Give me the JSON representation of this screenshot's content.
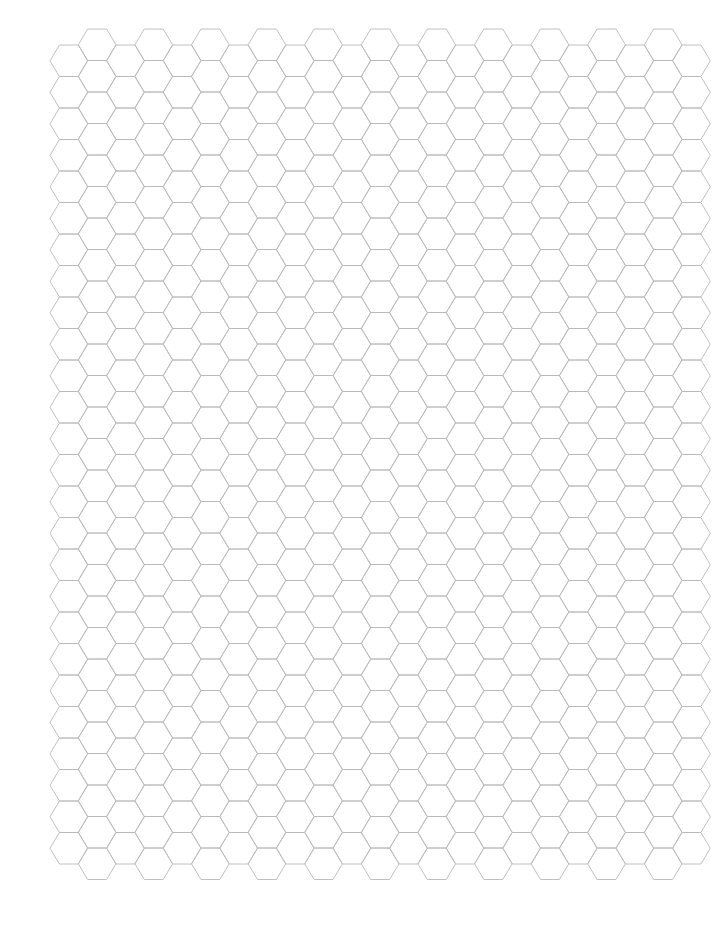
{
  "page": {
    "background": "#ffffff"
  },
  "hex_grid": {
    "orientation": "flat-top",
    "line_color": "#b9b9b9",
    "line_width": 0.9,
    "columns": 23,
    "column_pitch": 28.3,
    "row_pitch": 31.5,
    "hex_width": 37.7,
    "origin_x": 50,
    "even_column_top_y": 45,
    "odd_column_top_y": 29,
    "even_column_rows": 26,
    "odd_column_rows": 27
  }
}
